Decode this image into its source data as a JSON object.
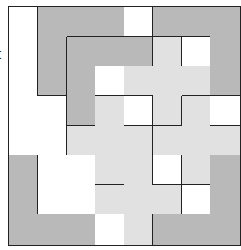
{
  "fragment_text": "t",
  "colors": {
    "D": "#b9b9b9",
    "L": "#e1e1e1",
    "W": "#ffffff",
    "line": "#222222"
  },
  "grid": {
    "rows": 8,
    "cols": 8,
    "fills": [
      [
        "W",
        "D",
        "D",
        "D",
        "W",
        "D",
        "D",
        "D"
      ],
      [
        "W",
        "D",
        "D",
        "D",
        "D",
        "L",
        "W",
        "D"
      ],
      [
        "W",
        "D",
        "D",
        "W",
        "L",
        "L",
        "L",
        "D"
      ],
      [
        "W",
        "W",
        "D",
        "L",
        "W",
        "L",
        "L",
        "W"
      ],
      [
        "W",
        "W",
        "L",
        "L",
        "L",
        "L",
        "L",
        "L"
      ],
      [
        "D",
        "W",
        "W",
        "L",
        "L",
        "W",
        "L",
        "D"
      ],
      [
        "D",
        "W",
        "W",
        "L",
        "L",
        "L",
        "W",
        "D"
      ],
      [
        "D",
        "D",
        "D",
        "W",
        "L",
        "D",
        "D",
        "D"
      ]
    ],
    "pieces": [
      [
        "w0",
        "A",
        "A",
        "A",
        "w1",
        "C",
        "C",
        "C"
      ],
      [
        "w0",
        "A",
        "B",
        "B",
        "B",
        "D",
        "w2",
        "C"
      ],
      [
        "w0",
        "A",
        "B",
        "w3",
        "D",
        "D",
        "D",
        "C"
      ],
      [
        "w0",
        "w0",
        "B",
        "E",
        "w4",
        "D",
        "F",
        "w5"
      ],
      [
        "w0",
        "w0",
        "E",
        "E",
        "E",
        "F",
        "F",
        "F"
      ],
      [
        "H",
        "w0",
        "w0",
        "E",
        "G",
        "w6",
        "F",
        "I"
      ],
      [
        "H",
        "w0",
        "w0",
        "G",
        "G",
        "G",
        "w7",
        "I"
      ],
      [
        "H",
        "H",
        "H",
        "w8",
        "G",
        "I",
        "I",
        "I"
      ]
    ]
  }
}
